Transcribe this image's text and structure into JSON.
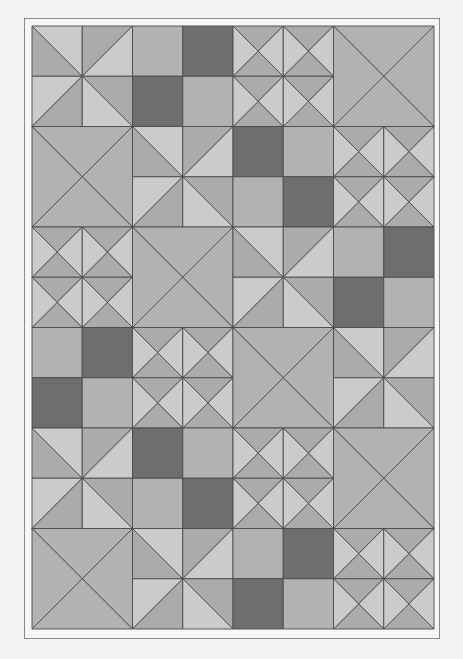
{
  "quilt": {
    "title": "Quilt pattern",
    "grid": {
      "rows": 6,
      "cols": 4,
      "block_size": 100.5,
      "origin_x": 1,
      "origin_y": 1
    },
    "colors": {
      "light": "#cbcbcb",
      "medium": "#ababab",
      "medium_alt": "#b2b2b2",
      "dark": "#6e6e6e",
      "line": "#4a4a4a",
      "background": "#f3f3f2",
      "frame": "#8a8a8a"
    },
    "block_types": {
      "A": "pinwheel",
      "B": "four-patch",
      "C": "small-hourglass",
      "D": "large-hourglass"
    },
    "layout": [
      [
        {
          "type": "A"
        },
        {
          "type": "B",
          "patches": [
            "medium",
            "dark",
            "dark",
            "medium"
          ]
        },
        {
          "type": "C"
        },
        {
          "type": "D"
        }
      ],
      [
        {
          "type": "D"
        },
        {
          "type": "A"
        },
        {
          "type": "B",
          "patches": [
            "dark",
            "medium",
            "medium",
            "dark"
          ]
        },
        {
          "type": "C"
        }
      ],
      [
        {
          "type": "C"
        },
        {
          "type": "D"
        },
        {
          "type": "A"
        },
        {
          "type": "B",
          "patches": [
            "medium",
            "dark",
            "dark",
            "medium"
          ]
        }
      ],
      [
        {
          "type": "B",
          "patches": [
            "medium",
            "dark",
            "dark",
            "medium"
          ]
        },
        {
          "type": "C"
        },
        {
          "type": "D"
        },
        {
          "type": "A"
        }
      ],
      [
        {
          "type": "A"
        },
        {
          "type": "B",
          "patches": [
            "dark",
            "medium",
            "medium",
            "dark"
          ]
        },
        {
          "type": "C"
        },
        {
          "type": "D"
        }
      ],
      [
        {
          "type": "D"
        },
        {
          "type": "A"
        },
        {
          "type": "B",
          "patches": [
            "medium",
            "dark",
            "dark",
            "medium"
          ]
        },
        {
          "type": "C"
        }
      ]
    ]
  }
}
